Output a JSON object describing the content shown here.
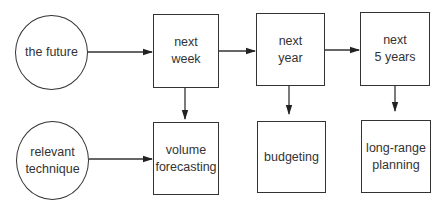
{
  "diagram": {
    "type": "flow",
    "colors": {
      "stroke": "#333333",
      "text": "#333333",
      "background": "#ffffff"
    },
    "row_top": {
      "source": {
        "id": "the-future",
        "shape": "circle",
        "lines": [
          "the future"
        ]
      },
      "boxes": [
        {
          "id": "next-week",
          "shape": "rect",
          "lines": [
            "next",
            "week"
          ]
        },
        {
          "id": "next-year",
          "shape": "rect",
          "lines": [
            "next",
            "year"
          ]
        },
        {
          "id": "next-5-years",
          "shape": "rect",
          "lines": [
            "next",
            "5 years"
          ]
        }
      ]
    },
    "row_bottom": {
      "source": {
        "id": "relevant-technique",
        "shape": "circle",
        "lines": [
          "relevant",
          "technique"
        ]
      },
      "boxes": [
        {
          "id": "volume-forecasting",
          "shape": "rect",
          "lines": [
            "volume",
            "forecasting"
          ]
        },
        {
          "id": "budgeting",
          "shape": "rect",
          "lines": [
            "budgeting"
          ]
        },
        {
          "id": "long-range-planning",
          "shape": "rect",
          "lines": [
            "long-range",
            "planning"
          ]
        }
      ]
    },
    "edges": [
      {
        "from": "the-future",
        "to": "next-week"
      },
      {
        "from": "next-week",
        "to": "next-year"
      },
      {
        "from": "next-year",
        "to": "next-5-years"
      },
      {
        "from": "next-week",
        "to": "volume-forecasting"
      },
      {
        "from": "next-year",
        "to": "budgeting"
      },
      {
        "from": "next-5-years",
        "to": "long-range-planning"
      },
      {
        "from": "relevant-technique",
        "to": "volume-forecasting"
      }
    ]
  }
}
